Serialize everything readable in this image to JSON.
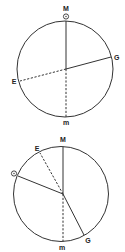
{
  "diagrams": [
    {
      "labels": {
        "top": "M",
        "sun": "☉",
        "right": "G",
        "left": "E",
        "bottom": "m"
      }
    },
    {
      "labels": {
        "top": "M",
        "upper_left": "E",
        "sun": "☉",
        "lower_right": "G",
        "bottom": "m"
      }
    }
  ],
  "colors": {
    "line": "#333333",
    "background": "#ffffff"
  }
}
